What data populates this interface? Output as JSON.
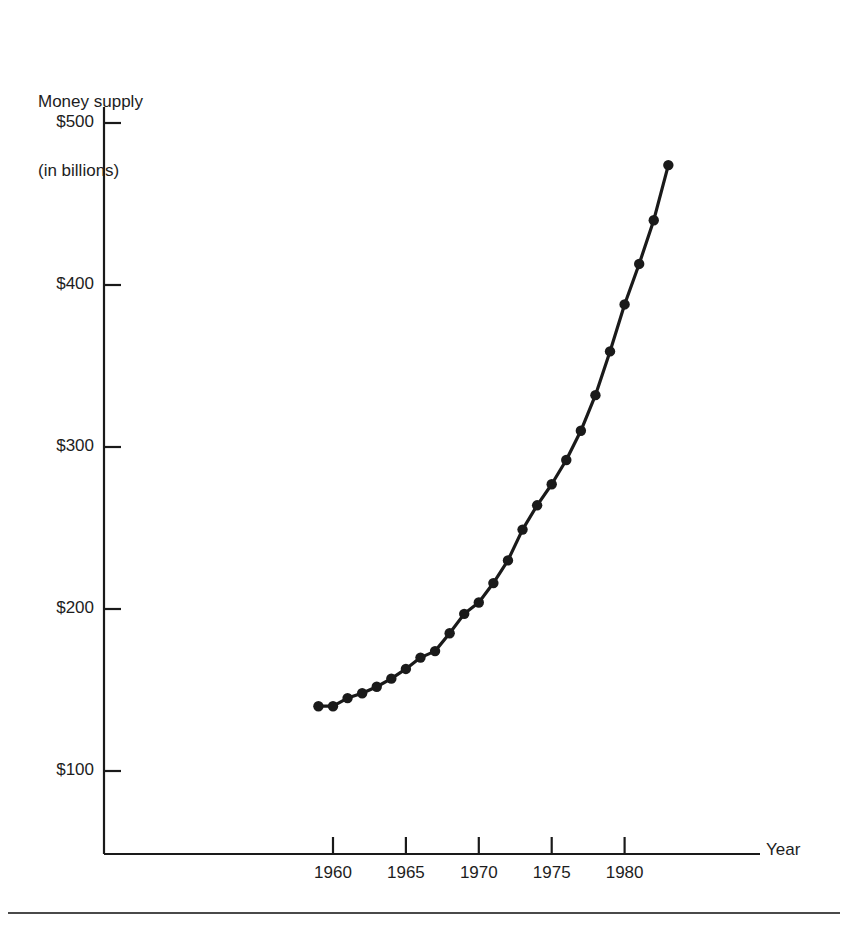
{
  "figure": {
    "background": "#ffffff",
    "ink_color": "#1a1a1a",
    "footer_note": ""
  },
  "chart_data": {
    "type": "line",
    "title": "",
    "subtitle": "",
    "ylabel": "Money supply",
    "ylabel_line2": "(in billions)",
    "xlabel": "Year",
    "grid": false,
    "legend": "none",
    "marker": "filled-circle",
    "xlim": [
      1957,
      1985
    ],
    "ylim": [
      63,
      520
    ],
    "xticks": [
      1960,
      1965,
      1970,
      1975,
      1980
    ],
    "xtick_labels": [
      "1960",
      "1965",
      "1970",
      "1975",
      "1980"
    ],
    "yticks": [
      100,
      200,
      300,
      400,
      500
    ],
    "ytick_labels": [
      "$100",
      "$200",
      "$300",
      "$400",
      "$500"
    ],
    "x": [
      1959,
      1960,
      1961,
      1962,
      1963,
      1964,
      1965,
      1966,
      1967,
      1968,
      1969,
      1970,
      1971,
      1972,
      1973,
      1974,
      1975,
      1976,
      1977,
      1978,
      1979,
      1980,
      1981,
      1982
    ],
    "values": [
      140,
      140,
      145,
      148,
      152,
      157,
      163,
      170,
      174,
      185,
      197,
      204,
      216,
      230,
      249,
      264,
      277,
      292,
      310,
      332,
      359,
      388,
      413,
      440
    ],
    "last_point": {
      "x": 1983,
      "y": 474
    },
    "series": [
      {
        "name": "Money supply (in billions)",
        "color": "#1a1a1a",
        "points": [
          {
            "year": 1959,
            "value": 140
          },
          {
            "year": 1960,
            "value": 140
          },
          {
            "year": 1961,
            "value": 145
          },
          {
            "year": 1962,
            "value": 148
          },
          {
            "year": 1963,
            "value": 152
          },
          {
            "year": 1964,
            "value": 157
          },
          {
            "year": 1965,
            "value": 163
          },
          {
            "year": 1966,
            "value": 170
          },
          {
            "year": 1967,
            "value": 174
          },
          {
            "year": 1968,
            "value": 185
          },
          {
            "year": 1969,
            "value": 197
          },
          {
            "year": 1970,
            "value": 204
          },
          {
            "year": 1971,
            "value": 216
          },
          {
            "year": 1972,
            "value": 230
          },
          {
            "year": 1973,
            "value": 249
          },
          {
            "year": 1974,
            "value": 264
          },
          {
            "year": 1975,
            "value": 277
          },
          {
            "year": 1976,
            "value": 292
          },
          {
            "year": 1977,
            "value": 310
          },
          {
            "year": 1978,
            "value": 332
          },
          {
            "year": 1979,
            "value": 359
          },
          {
            "year": 1980,
            "value": 388
          },
          {
            "year": 1981,
            "value": 413
          },
          {
            "year": 1982,
            "value": 440
          },
          {
            "year": 1983,
            "value": 474
          }
        ]
      }
    ]
  },
  "geometry": {
    "x_axis_y": 854,
    "y_axis_x": 104,
    "y_axis_top": 107,
    "x_axis_right": 760,
    "year_1960_px": 333,
    "px_per_year": 14.58,
    "value_100_px": 771,
    "px_per_100": 162
  }
}
